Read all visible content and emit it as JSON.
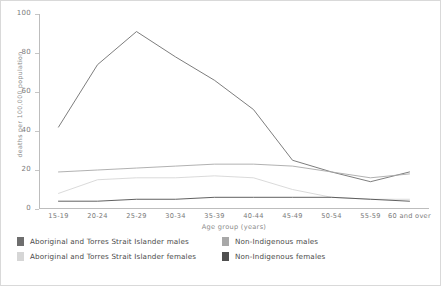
{
  "chart_data": {
    "type": "line",
    "title": "",
    "xlabel": "Age group (years)",
    "ylabel": "deaths per 100,000 population",
    "ylim": [
      0,
      100
    ],
    "yticks": [
      0,
      20,
      40,
      60,
      80,
      100
    ],
    "grid": false,
    "legend_position": "bottom",
    "categories": [
      "15-19",
      "20-24",
      "25-29",
      "30-34",
      "35-39",
      "40-44",
      "45-49",
      "50-54",
      "55-59",
      "60 and over"
    ],
    "series": [
      {
        "name": "Aboriginal and Torres Strait Islander males",
        "color": "#6e6e6e",
        "values": [
          42,
          74,
          91,
          78,
          66,
          51,
          25,
          19,
          14,
          19
        ]
      },
      {
        "name": "Non-Indigenous males",
        "color": "#a8a8a8",
        "values": [
          19,
          20,
          21,
          22,
          23,
          23,
          22,
          19,
          16,
          18
        ]
      },
      {
        "name": "Aboriginal and Torres Strait Islander females",
        "color": "#d6d6d6",
        "values": [
          8,
          15,
          16,
          16,
          17,
          16,
          10,
          6,
          5,
          5
        ]
      },
      {
        "name": "Non-Indigenous females",
        "color": "#4f4f4f",
        "values": [
          4,
          4,
          5,
          5,
          6,
          6,
          6,
          6,
          5,
          4
        ]
      }
    ]
  },
  "axis": {
    "y_title": "deaths per 100,000 population",
    "x_title": "Age group (years)",
    "y_tick_labels": [
      "100",
      "80",
      "60",
      "40",
      "20",
      "0"
    ],
    "x_tick_labels": [
      "15-19",
      "20-24",
      "25-29",
      "30-34",
      "35-39",
      "40-44",
      "45-49",
      "50-54",
      "55-59",
      "60 and over"
    ]
  },
  "legend": {
    "items": [
      {
        "label": "Aboriginal and Torres Strait Islander males",
        "color": "#6e6e6e"
      },
      {
        "label": "Aboriginal and Torres Strait Islander females",
        "color": "#d6d6d6"
      },
      {
        "label": "Non-Indigenous males",
        "color": "#a8a8a8"
      },
      {
        "label": "Non-Indigenous females",
        "color": "#4f4f4f"
      }
    ]
  }
}
